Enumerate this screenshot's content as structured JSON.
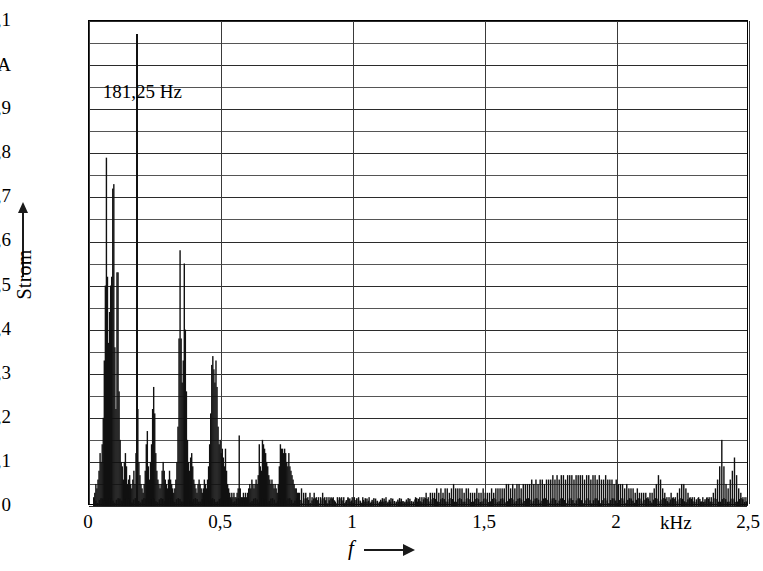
{
  "figure": {
    "y_axis_title": "Strom",
    "x_axis_title": "f",
    "x_unit": "kHz",
    "y_unit": "A"
  },
  "annotation": {
    "label": "181,25 Hz",
    "frequency_khz": 0.18125,
    "value": 1.07
  },
  "chart_data": {
    "type": "bar",
    "title": "",
    "subtitle": "",
    "xlabel": "f",
    "ylabel": "Strom",
    "x_unit": "kHz",
    "y_unit": "A",
    "xlim": [
      0,
      2.5
    ],
    "ylim": [
      0,
      1.1
    ],
    "grid": true,
    "legend": null,
    "x_ticks": [
      "0",
      "0,5",
      "1",
      "1,5",
      "2",
      "2,5"
    ],
    "x_tick_values": [
      0,
      0.5,
      1,
      1.5,
      2,
      2.5
    ],
    "y_ticks": [
      "0",
      "0,1",
      "0,2",
      "0,3",
      "0,4",
      "0,5",
      "0,6",
      "0,7",
      "0,8",
      "0,9",
      "A",
      "1,1"
    ],
    "y_tick_values": [
      0,
      0.1,
      0.2,
      0.3,
      0.4,
      0.5,
      0.6,
      0.7,
      0.8,
      0.9,
      1.0,
      1.1
    ],
    "y_minor_gridlines": true,
    "y_minor_step": 0.05,
    "annotations": [
      {
        "text": "181,25 Hz",
        "x": 0.18125,
        "y": 1.07,
        "type": "peak-marker"
      }
    ],
    "bar_width_khz": 0.0035,
    "x": [
      0.018,
      0.022,
      0.026,
      0.03,
      0.034,
      0.038,
      0.042,
      0.046,
      0.05,
      0.054,
      0.058,
      0.062,
      0.066,
      0.07,
      0.074,
      0.078,
      0.082,
      0.086,
      0.09,
      0.094,
      0.098,
      0.102,
      0.106,
      0.11,
      0.114,
      0.118,
      0.122,
      0.126,
      0.13,
      0.134,
      0.138,
      0.142,
      0.146,
      0.15,
      0.154,
      0.158,
      0.162,
      0.166,
      0.17,
      0.174,
      0.178,
      0.18125,
      0.185,
      0.189,
      0.193,
      0.197,
      0.201,
      0.205,
      0.209,
      0.213,
      0.217,
      0.221,
      0.225,
      0.229,
      0.233,
      0.237,
      0.241,
      0.245,
      0.249,
      0.253,
      0.257,
      0.261,
      0.265,
      0.269,
      0.273,
      0.277,
      0.281,
      0.285,
      0.289,
      0.293,
      0.297,
      0.301,
      0.305,
      0.309,
      0.313,
      0.317,
      0.321,
      0.325,
      0.329,
      0.333,
      0.337,
      0.341,
      0.345,
      0.349,
      0.353,
      0.357,
      0.361,
      0.365,
      0.369,
      0.373,
      0.377,
      0.381,
      0.385,
      0.389,
      0.393,
      0.397,
      0.401,
      0.405,
      0.409,
      0.413,
      0.417,
      0.421,
      0.425,
      0.429,
      0.433,
      0.437,
      0.441,
      0.445,
      0.449,
      0.453,
      0.457,
      0.461,
      0.465,
      0.469,
      0.473,
      0.477,
      0.481,
      0.485,
      0.489,
      0.493,
      0.497,
      0.501,
      0.505,
      0.509,
      0.513,
      0.517,
      0.521,
      0.525,
      0.529,
      0.533,
      0.537,
      0.541,
      0.545,
      0.549,
      0.553,
      0.557,
      0.561,
      0.565,
      0.569,
      0.573,
      0.577,
      0.581,
      0.585,
      0.589,
      0.593,
      0.597,
      0.601,
      0.605,
      0.609,
      0.613,
      0.617,
      0.621,
      0.625,
      0.629,
      0.633,
      0.637,
      0.641,
      0.645,
      0.649,
      0.653,
      0.657,
      0.661,
      0.665,
      0.669,
      0.673,
      0.677,
      0.681,
      0.685,
      0.689,
      0.693,
      0.697,
      0.701,
      0.705,
      0.709,
      0.713,
      0.717,
      0.721,
      0.725,
      0.729,
      0.733,
      0.737,
      0.741,
      0.745,
      0.749,
      0.753,
      0.757,
      0.761,
      0.765,
      0.769,
      0.773,
      0.777,
      0.781,
      0.785,
      0.789,
      0.793,
      0.797,
      0.805,
      0.813,
      0.821,
      0.829,
      0.837,
      0.845,
      0.853,
      0.861,
      0.869,
      0.877,
      0.885,
      0.893,
      0.901,
      0.909,
      0.917,
      0.925,
      0.933,
      0.941,
      0.949,
      0.957,
      0.965,
      0.973,
      0.981,
      0.989,
      0.997,
      1.005,
      1.013,
      1.021,
      1.029,
      1.037,
      1.045,
      1.053,
      1.061,
      1.069,
      1.077,
      1.085,
      1.093,
      1.101,
      1.109,
      1.117,
      1.125,
      1.133,
      1.141,
      1.149,
      1.157,
      1.165,
      1.173,
      1.181,
      1.189,
      1.197,
      1.205,
      1.213,
      1.221,
      1.229,
      1.237,
      1.245,
      1.253,
      1.261,
      1.269,
      1.277,
      1.285,
      1.293,
      1.301,
      1.309,
      1.317,
      1.325,
      1.333,
      1.341,
      1.349,
      1.357,
      1.365,
      1.373,
      1.381,
      1.389,
      1.397,
      1.405,
      1.413,
      1.421,
      1.429,
      1.437,
      1.445,
      1.453,
      1.461,
      1.469,
      1.477,
      1.485,
      1.493,
      1.501,
      1.509,
      1.517,
      1.525,
      1.533,
      1.541,
      1.549,
      1.557,
      1.565,
      1.573,
      1.581,
      1.589,
      1.597,
      1.605,
      1.613,
      1.621,
      1.629,
      1.637,
      1.645,
      1.653,
      1.661,
      1.669,
      1.677,
      1.685,
      1.693,
      1.701,
      1.709,
      1.717,
      1.725,
      1.733,
      1.741,
      1.749,
      1.757,
      1.765,
      1.773,
      1.781,
      1.789,
      1.797,
      1.805,
      1.813,
      1.821,
      1.829,
      1.837,
      1.845,
      1.853,
      1.861,
      1.869,
      1.877,
      1.885,
      1.893,
      1.901,
      1.909,
      1.917,
      1.925,
      1.933,
      1.941,
      1.949,
      1.957,
      1.965,
      1.973,
      1.981,
      1.989,
      1.997,
      2.005,
      2.013,
      2.021,
      2.029,
      2.037,
      2.045,
      2.053,
      2.061,
      2.069,
      2.077,
      2.085,
      2.093,
      2.101,
      2.109,
      2.117,
      2.125,
      2.133,
      2.141,
      2.149,
      2.157,
      2.165,
      2.173,
      2.181,
      2.189,
      2.197,
      2.205,
      2.213,
      2.221,
      2.229,
      2.237,
      2.245,
      2.253,
      2.261,
      2.269,
      2.277,
      2.285,
      2.293,
      2.301,
      2.309,
      2.317,
      2.325,
      2.333,
      2.341,
      2.349,
      2.357,
      2.365,
      2.373,
      2.381,
      2.389,
      2.397,
      2.405,
      2.413,
      2.421,
      2.429,
      2.437,
      2.445,
      2.453,
      2.461,
      2.469,
      2.477,
      2.485,
      2.493
    ],
    "values": [
      0.02,
      0.03,
      0.05,
      0.04,
      0.06,
      0.08,
      0.12,
      0.1,
      0.14,
      0.2,
      0.33,
      0.5,
      0.79,
      0.52,
      0.37,
      0.44,
      0.5,
      0.52,
      0.72,
      0.73,
      0.36,
      0.22,
      0.53,
      0.53,
      0.26,
      0.15,
      0.1,
      0.09,
      0.06,
      0.1,
      0.12,
      0.09,
      0.05,
      0.06,
      0.07,
      0.05,
      0.04,
      0.06,
      0.08,
      0.05,
      0.12,
      1.07,
      0.22,
      0.1,
      0.07,
      0.05,
      0.04,
      0.03,
      0.05,
      0.08,
      0.14,
      0.17,
      0.09,
      0.06,
      0.1,
      0.14,
      0.22,
      0.27,
      0.21,
      0.12,
      0.08,
      0.06,
      0.05,
      0.04,
      0.05,
      0.08,
      0.1,
      0.08,
      0.06,
      0.05,
      0.04,
      0.06,
      0.08,
      0.06,
      0.05,
      0.04,
      0.03,
      0.04,
      0.06,
      0.1,
      0.18,
      0.38,
      0.58,
      0.38,
      0.28,
      0.33,
      0.55,
      0.4,
      0.26,
      0.15,
      0.1,
      0.08,
      0.11,
      0.12,
      0.09,
      0.06,
      0.05,
      0.04,
      0.03,
      0.05,
      0.06,
      0.05,
      0.04,
      0.03,
      0.04,
      0.06,
      0.05,
      0.04,
      0.06,
      0.09,
      0.14,
      0.21,
      0.32,
      0.34,
      0.31,
      0.28,
      0.33,
      0.27,
      0.18,
      0.14,
      0.15,
      0.12,
      0.13,
      0.11,
      0.09,
      0.13,
      0.08,
      0.05,
      0.04,
      0.03,
      0.02,
      0.03,
      0.02,
      0.03,
      0.02,
      0.02,
      0.03,
      0.04,
      0.16,
      0.04,
      0.02,
      0.02,
      0.03,
      0.02,
      0.03,
      0.02,
      0.03,
      0.04,
      0.05,
      0.04,
      0.06,
      0.05,
      0.04,
      0.05,
      0.06,
      0.05,
      0.07,
      0.14,
      0.09,
      0.08,
      0.15,
      0.14,
      0.13,
      0.12,
      0.1,
      0.09,
      0.07,
      0.06,
      0.05,
      0.06,
      0.05,
      0.04,
      0.05,
      0.04,
      0.03,
      0.05,
      0.09,
      0.14,
      0.13,
      0.13,
      0.12,
      0.13,
      0.12,
      0.1,
      0.09,
      0.12,
      0.09,
      0.08,
      0.07,
      0.06,
      0.05,
      0.04,
      0.04,
      0.03,
      0.03,
      0.03,
      0.04,
      0.03,
      0.03,
      0.02,
      0.03,
      0.02,
      0.03,
      0.02,
      0.02,
      0.02,
      0.03,
      0.02,
      0.02,
      0.02,
      0.02,
      0.02,
      0.01,
      0.02,
      0.02,
      0.02,
      0.02,
      0.01,
      0.02,
      0.01,
      0.02,
      0.02,
      0.01,
      0.02,
      0.01,
      0.02,
      0.01,
      0.01,
      0.02,
      0.01,
      0.01,
      0.01,
      0.01,
      0.01,
      0.01,
      0.01,
      0.02,
      0.01,
      0.01,
      0.01,
      0.01,
      0.01,
      0.01,
      0.01,
      0.01,
      0.01,
      0.01,
      0.01,
      0.01,
      0.01,
      0.02,
      0.01,
      0.02,
      0.02,
      0.02,
      0.03,
      0.02,
      0.03,
      0.03,
      0.03,
      0.04,
      0.03,
      0.04,
      0.03,
      0.04,
      0.04,
      0.03,
      0.04,
      0.05,
      0.04,
      0.04,
      0.04,
      0.04,
      0.03,
      0.04,
      0.04,
      0.03,
      0.03,
      0.03,
      0.04,
      0.03,
      0.03,
      0.04,
      0.03,
      0.03,
      0.03,
      0.04,
      0.03,
      0.04,
      0.04,
      0.04,
      0.04,
      0.04,
      0.05,
      0.05,
      0.04,
      0.05,
      0.04,
      0.05,
      0.05,
      0.04,
      0.05,
      0.05,
      0.05,
      0.05,
      0.06,
      0.05,
      0.06,
      0.05,
      0.06,
      0.06,
      0.05,
      0.06,
      0.06,
      0.06,
      0.07,
      0.06,
      0.07,
      0.06,
      0.07,
      0.07,
      0.06,
      0.07,
      0.07,
      0.07,
      0.06,
      0.07,
      0.07,
      0.07,
      0.07,
      0.06,
      0.07,
      0.07,
      0.06,
      0.07,
      0.07,
      0.06,
      0.07,
      0.06,
      0.06,
      0.07,
      0.06,
      0.06,
      0.06,
      0.05,
      0.06,
      0.05,
      0.05,
      0.05,
      0.04,
      0.05,
      0.04,
      0.04,
      0.04,
      0.03,
      0.04,
      0.03,
      0.03,
      0.03,
      0.03,
      0.02,
      0.03,
      0.03,
      0.04,
      0.05,
      0.07,
      0.06,
      0.04,
      0.03,
      0.02,
      0.02,
      0.03,
      0.02,
      0.02,
      0.03,
      0.04,
      0.05,
      0.05,
      0.04,
      0.03,
      0.02,
      0.02,
      0.02,
      0.01,
      0.02,
      0.01,
      0.02,
      0.01,
      0.02,
      0.02,
      0.02,
      0.03,
      0.04,
      0.06,
      0.09,
      0.15,
      0.09,
      0.05,
      0.04,
      0.06,
      0.08,
      0.11,
      0.07,
      0.04,
      0.03,
      0.02,
      0.02,
      0.02
    ]
  }
}
